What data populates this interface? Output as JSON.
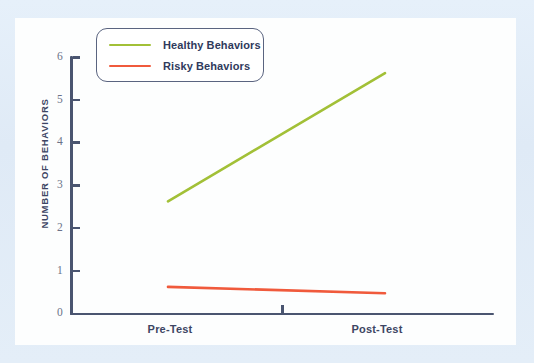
{
  "chart_data": {
    "type": "line",
    "title": "",
    "xlabel": "",
    "ylabel": "NUMBER OF BEHAVIORS",
    "categories": [
      "Pre-Test",
      "Post-Test"
    ],
    "x": [
      0,
      1
    ],
    "xlim": [
      0,
      1
    ],
    "ylim": [
      0,
      6
    ],
    "y_ticks": [
      0,
      1,
      2,
      3,
      4,
      5,
      6
    ],
    "y_tick_labels": [
      "0",
      "1",
      "2",
      "3",
      "4",
      "5",
      "6"
    ],
    "grid": false,
    "legend_position": "top-left",
    "series": [
      {
        "name": "Healthy Behaviors",
        "color": "#a6c council",
        "values": [
          2.6,
          5.6
        ]
      },
      {
        "name": "Risky Behaviors",
        "values": [
          0.6,
          0.45
        ]
      }
    ],
    "annotations": []
  },
  "legend": {
    "items": [
      {
        "label": "Healthy Behaviors",
        "color": "#a2c037"
      },
      {
        "label": "Risky Behaviors",
        "color": "#f05a3c"
      }
    ]
  },
  "axes": {
    "y_title": "NUMBER OF BEHAVIORS",
    "y_tick_labels": [
      "6",
      "5",
      "4",
      "3",
      "2",
      "1",
      "0"
    ],
    "x_tick_labels": [
      "Pre-Test",
      "Post-Test"
    ]
  },
  "colors": {
    "healthy_line": "#a2c037",
    "risky_line": "#f05a3c",
    "axis": "#4a5570",
    "text": "#3d4664",
    "tick_text": "#6b7288",
    "legend_border": "#5a6480",
    "card_background": "#fdfefe",
    "page_background": "#e0ecf7"
  }
}
